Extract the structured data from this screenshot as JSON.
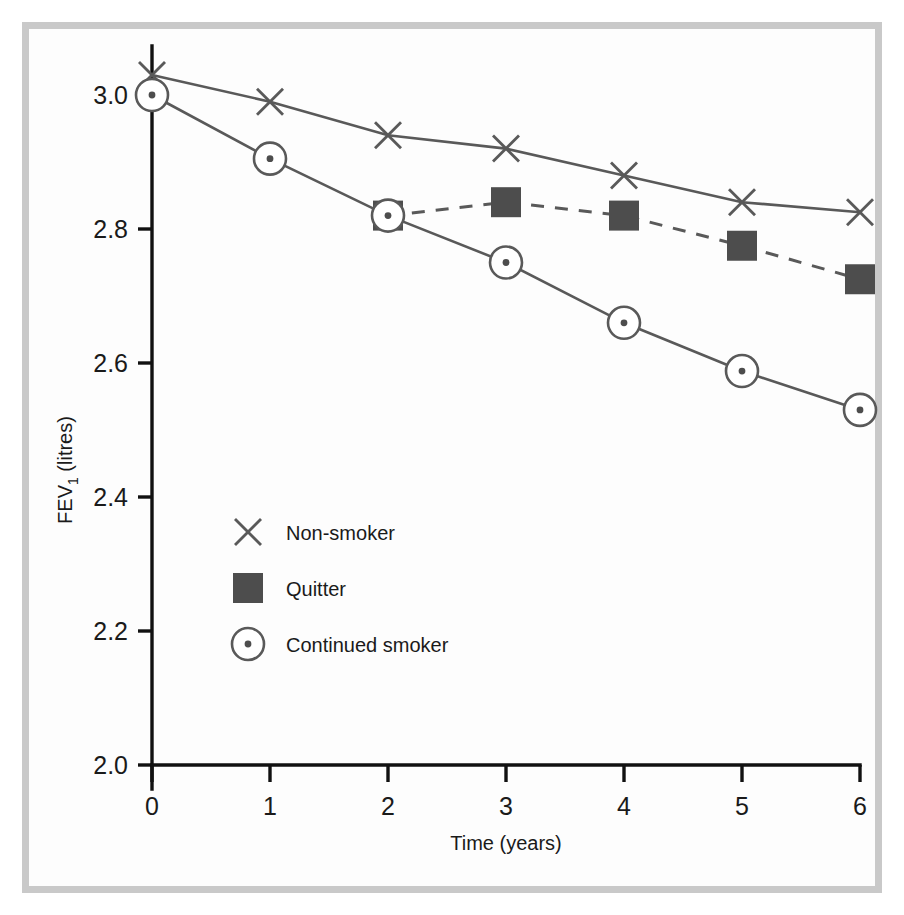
{
  "figure": {
    "background_color": "#ffffff",
    "frame_color": "#c9c9c9",
    "line_color": "#595959",
    "marker_fill_color": "#4d4d4d",
    "axis_color": "#111111"
  },
  "axes": {
    "y_title_main": "FEV",
    "y_title_sub": "1",
    "y_title_unit": " (litres)",
    "x_title": "Time (years)",
    "y_ticks": [
      "2.0",
      "2.2",
      "2.4",
      "2.6",
      "2.8",
      "3.0"
    ],
    "x_ticks": [
      "0",
      "1",
      "2",
      "3",
      "4",
      "5",
      "6"
    ]
  },
  "legend": {
    "items": [
      {
        "label": "Non-smoker",
        "marker": "x-marker",
        "color": "#595959"
      },
      {
        "label": "Quitter",
        "marker": "square-marker",
        "color": "#4d4d4d"
      },
      {
        "label": "Continued smoker",
        "marker": "circle-dot-marker",
        "color": "#595959"
      }
    ]
  },
  "chart_data": {
    "type": "line",
    "title": "",
    "xlabel": "Time (years)",
    "ylabel": "FEV1 (litres)",
    "xlim": [
      0,
      6
    ],
    "ylim": [
      2.0,
      3.05
    ],
    "grid": false,
    "legend_position": "inside-lower-left",
    "x": [
      0,
      1,
      2,
      3,
      4,
      5,
      6
    ],
    "series": [
      {
        "name": "Non-smoker",
        "marker": "x",
        "linestyle": "solid",
        "x": [
          0,
          1,
          2,
          3,
          4,
          5,
          6
        ],
        "values": [
          3.03,
          2.99,
          2.94,
          2.92,
          2.88,
          2.84,
          2.825
        ]
      },
      {
        "name": "Quitter",
        "marker": "square",
        "linestyle": "dashed",
        "x": [
          2,
          3,
          4,
          5,
          6
        ],
        "values": [
          2.82,
          2.84,
          2.82,
          2.775,
          2.725
        ]
      },
      {
        "name": "Continued smoker",
        "marker": "circle-dot",
        "linestyle": "solid",
        "x": [
          0,
          1,
          2,
          3,
          4,
          5,
          6
        ],
        "values": [
          3.0,
          2.905,
          2.82,
          2.75,
          2.66,
          2.588,
          2.53
        ]
      }
    ]
  }
}
